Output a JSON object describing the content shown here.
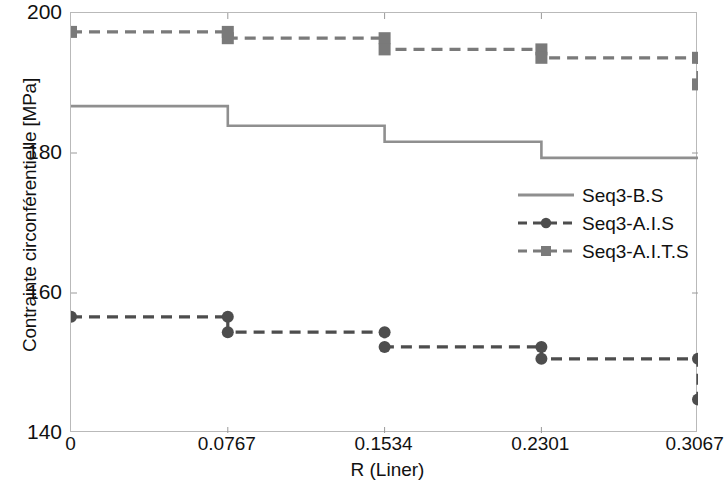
{
  "chart_data": {
    "type": "line",
    "title": "",
    "xlabel": "R (Liner)",
    "ylabel": "Contrainte circonférentielle [MPa]",
    "xlim": [
      0,
      0.3067
    ],
    "ylim": [
      140,
      200
    ],
    "xticks": [
      "0",
      "0.0767",
      "0.1534",
      "0.2301",
      "0.3067"
    ],
    "xtick_values": [
      0,
      0.0767,
      0.1534,
      0.2301,
      0.3067
    ],
    "yticks": [
      "140",
      "160",
      "180",
      "200"
    ],
    "ytick_values": [
      140,
      160,
      180,
      200
    ],
    "grid": false,
    "legend_position": "center-right",
    "x": [
      0,
      0.0767,
      0.1534,
      0.2301,
      0.3067
    ],
    "series": [
      {
        "name": "Seq3-B.S",
        "style": "solid",
        "marker": "none",
        "color": "#8f8f8f",
        "step": "post",
        "values": [
          186.7,
          183.9,
          181.6,
          179.3,
          179.3
        ],
        "segment_levels": [
          186.7,
          183.9,
          181.6,
          179.3
        ]
      },
      {
        "name": "Seq3-A.I.S",
        "style": "dashed",
        "marker": "circle",
        "color": "#4d4d4d",
        "step": "post",
        "values": [
          156.6,
          154.4,
          152.3,
          150.6,
          144.8
        ],
        "segment_levels": [
          156.6,
          154.4,
          152.3,
          150.6
        ],
        "marker_points": [
          {
            "x": 0,
            "y": 156.6
          },
          {
            "x": 0.0767,
            "y": 156.6
          },
          {
            "x": 0.0767,
            "y": 154.4
          },
          {
            "x": 0.1534,
            "y": 154.4
          },
          {
            "x": 0.1534,
            "y": 152.3
          },
          {
            "x": 0.2301,
            "y": 152.3
          },
          {
            "x": 0.2301,
            "y": 150.6
          },
          {
            "x": 0.3067,
            "y": 150.6
          },
          {
            "x": 0.3067,
            "y": 144.8
          }
        ]
      },
      {
        "name": "Seq3-A.I.T.S",
        "style": "dashed",
        "marker": "square",
        "color": "#7a7a7a",
        "step": "post",
        "values": [
          197.3,
          196.4,
          194.8,
          193.6,
          189.8
        ],
        "segment_levels": [
          197.3,
          196.4,
          194.8,
          193.6
        ],
        "marker_points": [
          {
            "x": 0,
            "y": 197.3
          },
          {
            "x": 0.0767,
            "y": 197.3
          },
          {
            "x": 0.0767,
            "y": 196.4
          },
          {
            "x": 0.1534,
            "y": 196.4
          },
          {
            "x": 0.1534,
            "y": 194.8
          },
          {
            "x": 0.2301,
            "y": 194.8
          },
          {
            "x": 0.2301,
            "y": 193.6
          },
          {
            "x": 0.3067,
            "y": 193.6
          },
          {
            "x": 0.3067,
            "y": 189.8
          }
        ]
      }
    ]
  },
  "legend": {
    "entries": [
      {
        "label": "Seq3-B.S"
      },
      {
        "label": "Seq3-A.I.S"
      },
      {
        "label": "Seq3-A.I.T.S"
      }
    ]
  },
  "axes": {
    "x_title": "R (Liner)",
    "y_title": "Contrainte circonférentielle [MPa]"
  }
}
